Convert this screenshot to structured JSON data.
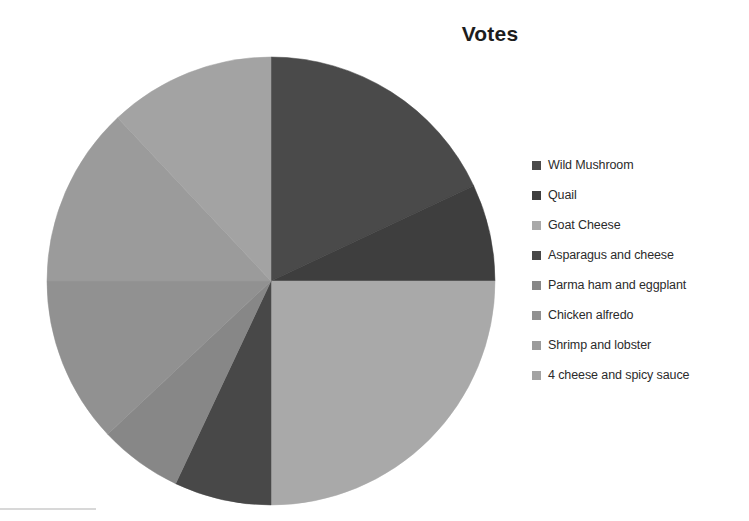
{
  "chart_data": {
    "type": "pie",
    "title": "Votes",
    "xlabel": "",
    "ylabel": "",
    "legend_position": "right",
    "grid": false,
    "start_angle_deg": 0,
    "direction": "clockwise",
    "center": {
      "x": 271,
      "y": 281
    },
    "radius": 224,
    "categories": [
      "Wild Mushroom",
      "Quail",
      "Goat Cheese",
      "Asparagus and cheese",
      "Parma ham and eggplant",
      "Chicken alfredo",
      "Shrimp and lobster",
      "4 cheese and spicy sauce"
    ],
    "values": [
      18,
      7,
      25,
      7,
      6,
      12,
      13,
      12
    ],
    "percentages": [
      18,
      7,
      25,
      7,
      6,
      12,
      13,
      12
    ],
    "slices": [
      {
        "label": "Wild Mushroom",
        "value": 18,
        "percent": 18,
        "color": "#4a4a4a",
        "start_deg": 0,
        "end_deg": 64.8
      },
      {
        "label": "Quail",
        "value": 7,
        "percent": 7,
        "color": "#3e3e3e",
        "start_deg": 64.8,
        "end_deg": 90.0
      },
      {
        "label": "Goat Cheese",
        "value": 25,
        "percent": 25,
        "color": "#a9a9a9",
        "start_deg": 90.0,
        "end_deg": 180.0
      },
      {
        "label": "Asparagus and cheese",
        "value": 7,
        "percent": 7,
        "color": "#484848",
        "start_deg": 180.0,
        "end_deg": 205.2
      },
      {
        "label": "Parma ham and eggplant",
        "value": 6,
        "percent": 6,
        "color": "#878787",
        "start_deg": 205.2,
        "end_deg": 226.8
      },
      {
        "label": "Chicken alfredo",
        "value": 12,
        "percent": 12,
        "color": "#919191",
        "start_deg": 226.8,
        "end_deg": 270.0
      },
      {
        "label": "Shrimp and lobster",
        "value": 13,
        "percent": 13,
        "color": "#9b9b9b",
        "start_deg": 270.0,
        "end_deg": 316.8
      },
      {
        "label": "4 cheese and spicy sauce",
        "value": 12,
        "percent": 12,
        "color": "#a3a3a3",
        "start_deg": 316.8,
        "end_deg": 360.0
      }
    ]
  },
  "title": {
    "text": "Votes"
  },
  "legend": {
    "items": [
      {
        "label": "Wild Mushroom",
        "color": "#4a4a4a"
      },
      {
        "label": "Quail",
        "color": "#3e3e3e"
      },
      {
        "label": "Goat Cheese",
        "color": "#a9a9a9"
      },
      {
        "label": "Asparagus and cheese",
        "color": "#484848"
      },
      {
        "label": "Parma ham and eggplant",
        "color": "#878787"
      },
      {
        "label": "Chicken alfredo",
        "color": "#919191"
      },
      {
        "label": "Shrimp and lobster",
        "color": "#9b9b9b"
      },
      {
        "label": "4 cheese and spicy sauce",
        "color": "#a3a3a3"
      }
    ]
  }
}
